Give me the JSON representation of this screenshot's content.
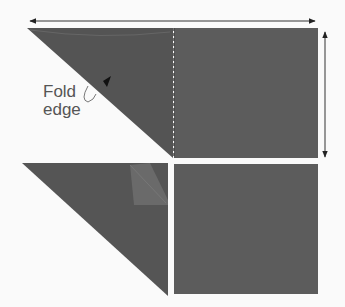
{
  "diagram": {
    "title": "",
    "labels": {
      "fold_line1": "Fold",
      "fold_line2": "edge"
    },
    "colors": {
      "background": "#fafafa",
      "fabric": "#5a5a5a",
      "fabric_dark": "#4e4e4e",
      "flap": "#6a6a6a",
      "arrow": "#222222",
      "text": "#555555"
    },
    "steps": [
      {
        "name": "step-1",
        "description": "Folded triangle attached to square with horizontal and vertical dimension arrows"
      },
      {
        "name": "step-2",
        "description": "Triangle with folded corner flap next to separate square"
      }
    ]
  }
}
